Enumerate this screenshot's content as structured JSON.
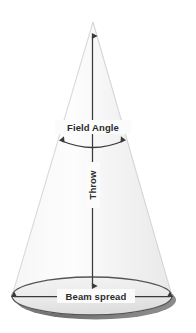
{
  "figure": {
    "name": "light-beam-cone-diagram",
    "background_color": "#ffffff",
    "labels": {
      "field_angle": "Field Angle",
      "throw": "Throw",
      "beam_spread": "Beam spread"
    },
    "colors": {
      "cone_fill_light": "#fdfdfd",
      "cone_fill_mid": "#f1f1f1",
      "cone_edge": "#dcdcdc",
      "base_fill": "#ececec",
      "base_edge": "#5a5a5a",
      "shadow": "#6e6e6e",
      "arrow": "#3a3a3a",
      "text": "#2b2b2b"
    },
    "geometry": {
      "apex_x": 93,
      "apex_y": 22,
      "base_center_x": 92,
      "base_center_y": 296,
      "base_radius_x": 80,
      "base_radius_y": 19
    },
    "annotations": [
      {
        "id": "throw-dimension",
        "label": "Throw",
        "type": "double-arrow-vertical",
        "orientation": "vertical",
        "rotation_deg": -90
      },
      {
        "id": "field-angle-dimension",
        "label": "Field Angle",
        "type": "arc-double-arrow",
        "orientation": "arc"
      },
      {
        "id": "beam-spread-dimension",
        "label": "Beam spread",
        "type": "double-arrow-horizontal",
        "orientation": "horizontal"
      }
    ]
  }
}
